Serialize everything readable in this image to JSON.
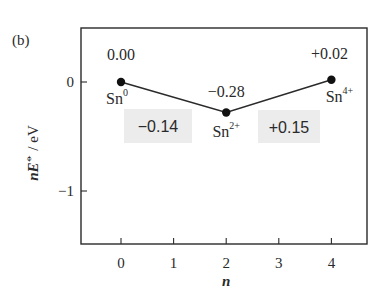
{
  "panel_label": "(b)",
  "chart_data": {
    "type": "line",
    "title": "",
    "xlabel": "n",
    "ylabel": "nE° / eV",
    "ylabel_parts": {
      "n": "n",
      "E": "E",
      "symbol": "⦵",
      "unit": " / eV"
    },
    "x_ticks": [
      0,
      1,
      2,
      3,
      4
    ],
    "x_tick_labels": [
      "0",
      "1",
      "2",
      "3",
      "4"
    ],
    "y_ticks": [
      0,
      -1
    ],
    "y_tick_labels": [
      "0",
      "−1"
    ],
    "xlim": [
      -0.75,
      4.7
    ],
    "ylim": [
      -1.5,
      0.5
    ],
    "grid": false,
    "legend": null,
    "series": [
      {
        "name": "Sn oxidation states",
        "x": [
          0,
          2,
          4
        ],
        "y": [
          0.0,
          -0.28,
          0.02
        ],
        "point_labels": [
          "0.00",
          "−0.28",
          "+0.02"
        ],
        "species": [
          {
            "base": "Sn",
            "sup": "0"
          },
          {
            "base": "Sn",
            "sup": "2+"
          },
          {
            "base": "Sn",
            "sup": "4+"
          }
        ]
      }
    ],
    "annotations": [
      {
        "text": "−0.14",
        "between": [
          0,
          2
        ],
        "meaning": "slope Sn0 to Sn2+"
      },
      {
        "text": "+0.15",
        "between": [
          2,
          4
        ],
        "meaning": "slope Sn2+ to Sn4+"
      }
    ]
  },
  "colors": {
    "line": "#2a2a2a",
    "marker": "#111111",
    "axis": "#2a2a2a",
    "annotation_box": "#ececec",
    "text": "#2a2a2a"
  }
}
